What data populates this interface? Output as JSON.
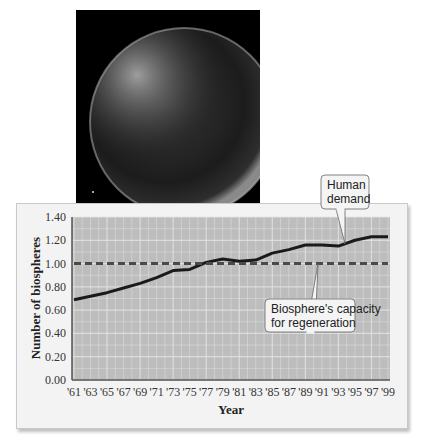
{
  "photo": {
    "subject": "earth-globe-image"
  },
  "chart_data": {
    "type": "line",
    "title": "",
    "xlabel": "Year",
    "ylabel": "Number of biospheres",
    "ylim": [
      0,
      1.4
    ],
    "yticks": [
      "0.00",
      "0.20",
      "0.40",
      "0.60",
      "0.80",
      "1.00",
      "1.20",
      "1.40"
    ],
    "categories": [
      "'61",
      "'63",
      "'65",
      "'67",
      "'69",
      "'71",
      "'73",
      "'75",
      "'77",
      "'79",
      "'81",
      "'83",
      "'85",
      "'87",
      "'89",
      "'91",
      "'93",
      "'95",
      "'97",
      "'99"
    ],
    "grid": true,
    "series": [
      {
        "name": "Human demand",
        "style": "solid",
        "color": "#1a1a1a",
        "values": [
          0.69,
          0.72,
          0.75,
          0.79,
          0.83,
          0.88,
          0.94,
          0.95,
          1.01,
          1.04,
          1.02,
          1.03,
          1.09,
          1.12,
          1.16,
          1.16,
          1.15,
          1.2,
          1.23,
          1.23
        ]
      },
      {
        "name": "Biosphere's capacity for regeneration",
        "style": "dashed",
        "color": "#4a4a4a",
        "values": [
          1.0,
          1.0,
          1.0,
          1.0,
          1.0,
          1.0,
          1.0,
          1.0,
          1.0,
          1.0,
          1.0,
          1.0,
          1.0,
          1.0,
          1.0,
          1.0,
          1.0,
          1.0,
          1.0,
          1.0
        ]
      }
    ],
    "annotations": [
      {
        "text_lines": [
          "Human",
          "demand"
        ],
        "points_to": "Human demand"
      },
      {
        "text_lines": [
          "Biosphere's capacity",
          "for regeneration"
        ],
        "points_to": "Biosphere's capacity for regeneration"
      }
    ],
    "colors": {
      "plot_bg": "#bdbdbd",
      "grid": "#e4e4e4",
      "panel_bg": "#f3f3f3"
    }
  }
}
